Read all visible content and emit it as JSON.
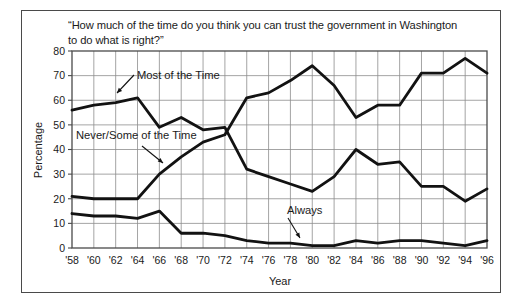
{
  "figure": {
    "title_line1": "“How much of the time do you think you can trust the government in Washington",
    "title_line2": "to do what is right?”"
  },
  "chart_data": {
    "type": "line",
    "title": "“How much of the time do you think you can trust the government in Washington to do what is right?”",
    "xlabel": "Year",
    "ylabel": "Percentage",
    "xlim": [
      1958,
      1996
    ],
    "ylim": [
      0,
      80
    ],
    "grid": true,
    "legend": "inline-annotations",
    "x": [
      1958,
      1960,
      1962,
      1964,
      1966,
      1968,
      1970,
      1972,
      1974,
      1976,
      1978,
      1980,
      1982,
      1984,
      1986,
      1988,
      1990,
      1992,
      1994,
      1996
    ],
    "xticklabels": [
      "'58",
      "'60",
      "'62",
      "'64",
      "'66",
      "'68",
      "'70",
      "'72",
      "'74",
      "'76",
      "'78",
      "'80",
      "'82",
      "'84",
      "'86",
      "'88",
      "'90",
      "'92",
      "'94",
      "'96"
    ],
    "yticks": [
      0,
      10,
      20,
      30,
      40,
      50,
      60,
      70,
      80
    ],
    "yticklabels": [
      "0",
      "10",
      "20",
      "30",
      "40",
      "50",
      "60",
      "70",
      "80"
    ],
    "series": [
      {
        "name": "Most of the Time",
        "values": [
          56,
          58,
          59,
          61,
          49,
          53,
          48,
          49,
          32,
          29,
          26,
          23,
          29,
          40,
          34,
          35,
          25,
          25,
          19,
          24
        ]
      },
      {
        "name": "Never/Some of the Time",
        "values": [
          21,
          20,
          20,
          20,
          30,
          37,
          43,
          46,
          61,
          63,
          68,
          74,
          66,
          53,
          58,
          58,
          71,
          71,
          77,
          71
        ]
      },
      {
        "name": "Always",
        "values": [
          14,
          13,
          13,
          12,
          15,
          6,
          6,
          5,
          3,
          2,
          2,
          1,
          1,
          3,
          2,
          3,
          3,
          2,
          1,
          3
        ]
      }
    ],
    "annotations": [
      {
        "label": "Most of the Time",
        "points_to_series": "Most of the Time",
        "points_to_x": 1964
      },
      {
        "label": "Never/Some of the Time",
        "points_to_series": "Never/Some of the Time",
        "points_to_x": 1967
      },
      {
        "label": "Always",
        "points_to_series": "Always",
        "points_to_x": 1980
      }
    ]
  }
}
